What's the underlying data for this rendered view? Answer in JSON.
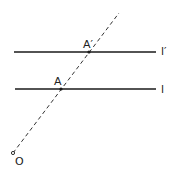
{
  "diagram": {
    "labels": {
      "A_prime": "A′",
      "A": "A",
      "O": "O",
      "l_prime": "l′",
      "l": "l"
    },
    "colors": {
      "line": "#1a1a1a",
      "background": "#ffffff"
    },
    "elements": [
      {
        "type": "line",
        "name": "l'",
        "from": [
          14,
          52
        ],
        "to": [
          156,
          52
        ]
      },
      {
        "type": "line",
        "name": "l",
        "from": [
          15,
          89
        ],
        "to": [
          156,
          89
        ]
      },
      {
        "type": "dashed-ray",
        "from": "O",
        "through": [
          "A",
          "A'"
        ]
      },
      {
        "type": "point",
        "name": "O",
        "at": [
          13,
          153
        ]
      },
      {
        "type": "point",
        "name": "A",
        "at": [
          61,
          89
        ]
      },
      {
        "type": "point",
        "name": "A'",
        "at": [
          89,
          52
        ]
      }
    ]
  }
}
